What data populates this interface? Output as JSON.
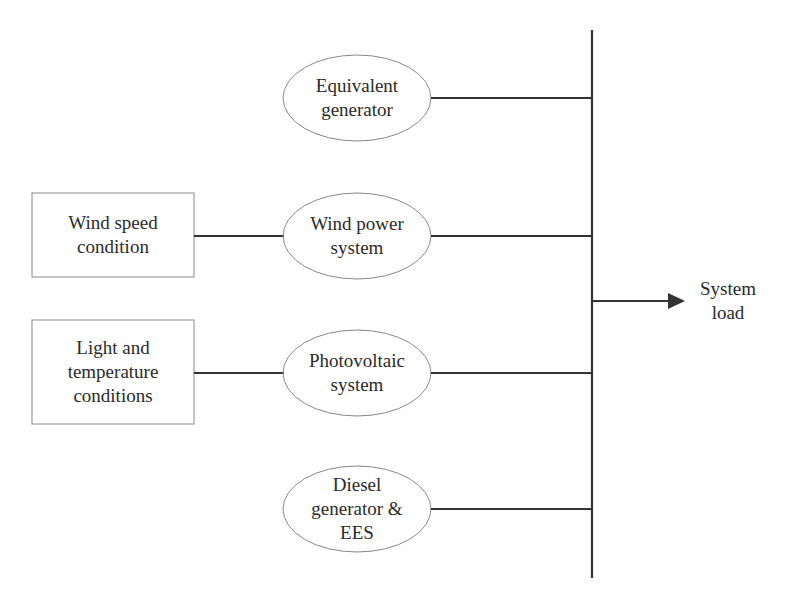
{
  "diagram": {
    "bus": {
      "label": "System load",
      "line1": "System",
      "line2": "load"
    },
    "sources": [
      {
        "name": "Equivalent generator",
        "lines": [
          "Equivalent",
          "generator"
        ]
      },
      {
        "name": "Wind power system",
        "lines": [
          "Wind power",
          "system"
        ]
      },
      {
        "name": "Photovoltaic system",
        "lines": [
          "Photovoltaic",
          "system"
        ]
      },
      {
        "name": "Diesel generator & EES",
        "lines": [
          "Diesel",
          "generator &",
          "EES"
        ]
      }
    ],
    "conditions": [
      {
        "name": "Wind speed condition",
        "lines": [
          "Wind speed",
          "condition"
        ]
      },
      {
        "name": "Light and temperature conditions",
        "lines": [
          "Light and",
          "temperature",
          "conditions"
        ]
      }
    ],
    "colors": {
      "stroke": "#333333",
      "thin_stroke": "#777777",
      "background": "#ffffff"
    }
  }
}
